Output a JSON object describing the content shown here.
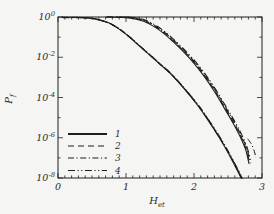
{
  "figure": {
    "colors": {
      "line": "#1f1f1f",
      "background": "#f5f5f3",
      "text": "#2b2b2b"
    }
  },
  "chart_data": {
    "type": "line",
    "title": "",
    "xlabel": {
      "base": "H",
      "sub": "et"
    },
    "ylabel": {
      "base": "P",
      "sub": "f"
    },
    "x_axis": {
      "min": 0,
      "max": 3,
      "major_ticks": [
        0,
        1,
        2,
        3
      ],
      "tick_labels": [
        "0",
        "1",
        "2",
        "3"
      ],
      "minor_tick_step": 0.1
    },
    "y_axis": {
      "scale": "log",
      "exp_min": -8,
      "exp_max": 0,
      "major_tick_exps": [
        0,
        -2,
        -4,
        -6,
        -8
      ],
      "minor_tick_exps": [
        -1,
        -3,
        -5,
        -7
      ],
      "tick_label_base": "10",
      "tick_label_exps": [
        "0",
        "-2",
        "-4",
        "-6",
        "-8"
      ]
    },
    "legend": {
      "position": "lower-left",
      "items": [
        {
          "label": "1",
          "style": "solid"
        },
        {
          "label": "2",
          "style": "dashed"
        },
        {
          "label": "3",
          "style": "dashdot"
        },
        {
          "label": "4",
          "style": "dashdotdot"
        }
      ]
    },
    "bundles": [
      {
        "name": "lower-curve-family",
        "note": "all four line styles nearly coincide",
        "points_x_log10y": [
          [
            0.05,
            -0.005
          ],
          [
            0.3,
            -0.01
          ],
          [
            0.45,
            -0.04
          ],
          [
            0.6,
            -0.13
          ],
          [
            0.75,
            -0.3
          ],
          [
            0.9,
            -0.6
          ],
          [
            1.05,
            -1.0
          ],
          [
            1.2,
            -1.45
          ],
          [
            1.35,
            -1.9
          ],
          [
            1.5,
            -2.35
          ],
          [
            1.65,
            -2.8
          ],
          [
            1.8,
            -3.35
          ],
          [
            1.95,
            -3.95
          ],
          [
            2.1,
            -4.6
          ],
          [
            2.25,
            -5.35
          ],
          [
            2.4,
            -6.15
          ],
          [
            2.55,
            -7.05
          ],
          [
            2.7,
            -8.05
          ],
          [
            2.76,
            -8.5
          ]
        ]
      },
      {
        "name": "upper-curve-family",
        "note": "all four line styles nearly coincide",
        "points_x_log10y": [
          [
            0.7,
            -0.005
          ],
          [
            0.95,
            -0.02
          ],
          [
            1.1,
            -0.07
          ],
          [
            1.25,
            -0.2
          ],
          [
            1.4,
            -0.45
          ],
          [
            1.55,
            -0.8
          ],
          [
            1.7,
            -1.25
          ],
          [
            1.85,
            -1.75
          ],
          [
            2.0,
            -2.3
          ],
          [
            2.15,
            -2.95
          ],
          [
            2.3,
            -3.7
          ],
          [
            2.45,
            -4.55
          ],
          [
            2.58,
            -5.3
          ],
          [
            2.68,
            -5.95
          ],
          [
            2.76,
            -6.6
          ],
          [
            2.81,
            -7.3
          ]
        ]
      }
    ],
    "fragments": [
      {
        "name": "end-hook",
        "style": "dashdot",
        "points_x_log10y": [
          [
            2.79,
            -6.05
          ],
          [
            2.85,
            -6.35
          ],
          [
            2.89,
            -6.7
          ],
          [
            2.91,
            -7.0
          ]
        ]
      }
    ]
  }
}
